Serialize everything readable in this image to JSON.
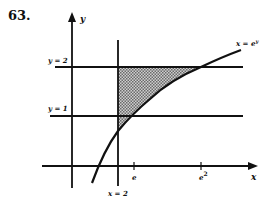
{
  "problem": {
    "number": "63."
  },
  "axes": {
    "x_label": "x",
    "y_label": "y"
  },
  "lines": {
    "y2": "y = 2",
    "y1": "y = 1",
    "x2": "x = 2",
    "curve": "x = e",
    "curve_exp": "y"
  },
  "ticks": {
    "e": "e",
    "e2": "e",
    "e2_exp": "2"
  },
  "colors": {
    "ink": "#111111",
    "shade": "#9a9a9a"
  }
}
